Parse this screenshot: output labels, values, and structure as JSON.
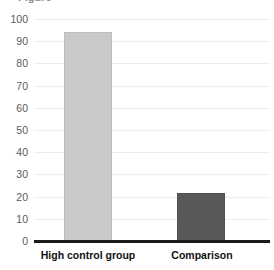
{
  "chart_data": {
    "type": "bar",
    "title": "",
    "xlabel": "",
    "ylabel": "",
    "categories": [
      "High control group",
      "Comparison"
    ],
    "values": [
      94,
      21.5
    ],
    "ylim": [
      0,
      100
    ],
    "yticks": [
      0,
      10,
      20,
      30,
      40,
      50,
      60,
      70,
      80,
      90,
      100
    ],
    "ytick_labels": [
      "0",
      "10",
      "20",
      "30",
      "40",
      "50",
      "60",
      "70",
      "80",
      "90",
      "100"
    ],
    "grid": true,
    "legend": false,
    "legend_position": "none",
    "bar_colors": [
      "#c9c9c9",
      "#585858"
    ],
    "bar_border_colors": [
      "#bdbdbd",
      "#4f4f4f"
    ],
    "axis_color": "#1a1a1a",
    "gridline_color": "#ededed",
    "tick_label_color": "#5a5a5a",
    "category_label_color": "#111111",
    "clipped_title_fragment": "Figure"
  }
}
